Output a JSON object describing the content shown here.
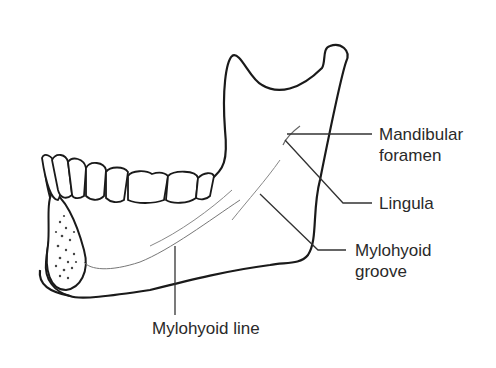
{
  "figure": {
    "labels": {
      "mandibular_foramen_line1": "Mandibular",
      "mandibular_foramen_line2": "foramen",
      "lingula": "Lingula",
      "mylohyoid_groove_line1": "Mylohyoid",
      "mylohyoid_groove_line2": "groove",
      "mylohyoid_line": "Mylohyoid line"
    },
    "colors": {
      "outline": "#1a1a1a",
      "leader": "#333333",
      "text": "#2a2a2a",
      "background": "#ffffff"
    }
  }
}
